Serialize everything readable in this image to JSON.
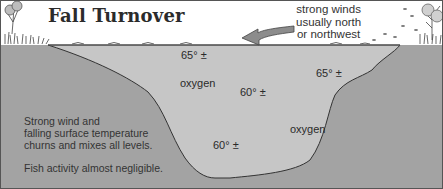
{
  "title": "Fall Turnover",
  "wind_note": {
    "lines": [
      "strong winds",
      "usually north",
      "or northwest"
    ],
    "arrow_direction": "left"
  },
  "water_labels": [
    {
      "id": "temp-upper-left",
      "text": "65° ±"
    },
    {
      "id": "oxygen-upper",
      "text": "oxygen"
    },
    {
      "id": "temp-upper-right",
      "text": "65° ±"
    },
    {
      "id": "temp-middle",
      "text": "60° ±"
    },
    {
      "id": "oxygen-lower",
      "text": "oxygen"
    },
    {
      "id": "temp-bottom",
      "text": "60° ±"
    }
  ],
  "description": {
    "lines": [
      "Strong wind and",
      "falling surface temperature",
      "churns and mixes all levels."
    ],
    "note": "Fish activity almost negligible."
  },
  "colors": {
    "ground": "#a3a3a3",
    "water": "#c6c6c6",
    "sky": "#ffffff",
    "outline": "#333333",
    "arrow": "#8c8c8c"
  }
}
